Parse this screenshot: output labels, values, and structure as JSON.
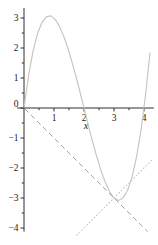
{
  "figure": {
    "background": "#ffffff",
    "axis_color": "#2e2e2e",
    "label_color": "#1b1b1b",
    "origin_px": [
      24,
      108
    ],
    "px_per_unit": 30,
    "x_axis": {
      "label": "x",
      "label_pos": [
        86,
        129
      ],
      "range": [
        -0.23,
        4.33
      ],
      "tick_values": [
        1,
        2,
        3,
        4
      ],
      "tick_labels": [
        "1",
        "2",
        "3",
        "4"
      ],
      "minor_tick_values": [
        0.5,
        1.5,
        2.5,
        3.5
      ]
    },
    "y_axis": {
      "label": "",
      "range": [
        -4.12,
        3.33
      ],
      "tick_values": [
        3,
        2,
        1,
        0,
        -1,
        -2,
        -3,
        -4
      ],
      "tick_labels": [
        "3",
        "2",
        "1",
        "0",
        "−1",
        "−2",
        "−3",
        "−4"
      ],
      "minor_tick_values": [
        2.5,
        1.5,
        0.5,
        -0.5,
        -1.5,
        -2.5,
        -3.5
      ]
    }
  },
  "chart_data": {
    "type": "line",
    "title": "",
    "xlabel": "x",
    "ylabel": "",
    "xlim": [
      0,
      4.2
    ],
    "ylim": [
      -4.2,
      3.3
    ],
    "grid": false,
    "legend": "none",
    "series": [
      {
        "name": "cubic-curve",
        "function": "y = x^3 - 6x^2 + 8x",
        "style": "solid",
        "color": "#c9c5ba",
        "width": 1.15,
        "points": [
          [
            0,
            0
          ],
          [
            0.15,
            1.068
          ],
          [
            0.3,
            1.887
          ],
          [
            0.45,
            2.476
          ],
          [
            0.6,
            2.856
          ],
          [
            0.75,
            3.047
          ],
          [
            0.9,
            3.069
          ],
          [
            1.05,
            2.943
          ],
          [
            1.2,
            2.688
          ],
          [
            1.35,
            2.325
          ],
          [
            1.5,
            1.875
          ],
          [
            1.65,
            1.357
          ],
          [
            1.8,
            0.792
          ],
          [
            1.95,
            0.2
          ],
          [
            2.1,
            -0.399
          ],
          [
            2.25,
            -0.984
          ],
          [
            2.4,
            -1.536
          ],
          [
            2.55,
            -2.034
          ],
          [
            2.7,
            -2.457
          ],
          [
            2.85,
            -2.786
          ],
          [
            3,
            -3
          ],
          [
            3.15,
            -3.08
          ],
          [
            3.3,
            -3.003
          ],
          [
            3.45,
            -2.751
          ],
          [
            3.6,
            -2.304
          ],
          [
            3.75,
            -1.641
          ],
          [
            3.9,
            -0.741
          ],
          [
            4.05,
            0.415
          ],
          [
            4.2,
            1.848
          ]
        ]
      },
      {
        "name": "tangent-dashed-line",
        "function": "y = -x (tangent at (3, -3))",
        "style": "dashed",
        "color": "#a2a2a2",
        "width": 1.0,
        "points": [
          [
            0.03,
            -0.03
          ],
          [
            4.12,
            -4.12
          ]
        ]
      },
      {
        "name": "normal-dotted-line",
        "function": "y = x - 6 (normal at (3, -3))",
        "style": "dotted",
        "color": "#c8c8c8",
        "width": 1.1,
        "points": [
          [
            1.76,
            -4.24
          ],
          [
            4.3,
            -1.7
          ]
        ]
      }
    ]
  }
}
